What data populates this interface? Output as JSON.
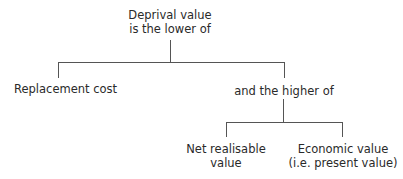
{
  "diagram": {
    "root": {
      "line1": "Deprival value",
      "line2": "is the lower of"
    },
    "left_child": {
      "label": "Replacement cost"
    },
    "right_child": {
      "label": "and the higher of"
    },
    "grandchildren": [
      {
        "line1": "Net realisable",
        "line2": "value"
      },
      {
        "line1": "Economic value",
        "line2": "(i.e. present value)"
      }
    ],
    "colors": {
      "line": "#555555",
      "text": "#2a2a2a",
      "background": "#ffffff"
    }
  }
}
